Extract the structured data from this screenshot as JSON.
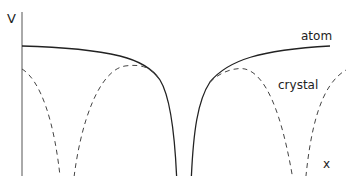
{
  "figure": {
    "y_axis_label": "V",
    "x_axis_label": "x",
    "curve_labels": {
      "atom": "atom",
      "crystal": "crystal"
    },
    "colors": {
      "line": "#222222",
      "axis": "#555555",
      "background": "#ffffff"
    }
  }
}
